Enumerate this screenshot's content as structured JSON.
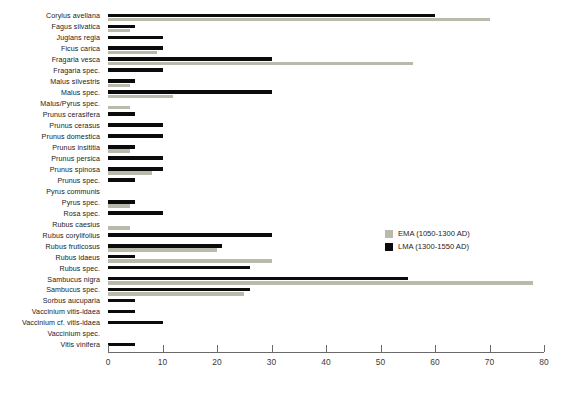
{
  "chart_data": {
    "type": "bar",
    "orientation": "horizontal",
    "title": "",
    "subtitle": "",
    "xlabel": "",
    "ylabel": "",
    "xlim": [
      0,
      80
    ],
    "xticks": [
      0,
      10,
      20,
      30,
      40,
      50,
      60,
      70,
      80
    ],
    "grid": false,
    "legend_position": "middle-right",
    "colors": {
      "ema": "#b9b9ac",
      "lma": "#0b0b0b",
      "axis": "#6a6a6a",
      "text": "#222222",
      "background": "#ffffff"
    },
    "categories": [
      "Corylus avellana",
      "Fagus silvatica",
      "Juglans regia",
      "Ficus carica",
      "Fragaria vesca",
      "Fragaria spec.",
      "Malus silvestris",
      "Malus spec.",
      "Malus/Pyrus spec.",
      "Prunus cerasifera",
      "Prunus cerasus",
      "Prunus domestica",
      "Prunus insititia",
      "Prunus persica",
      "Prunus spinosa",
      "Prunus spec.",
      "Pyrus communis",
      "Pyrus spec.",
      "Rosa spec.",
      "Rubus caesius",
      "Rubus corylifolius",
      "Rubus fruticosus",
      "Rubus idaeus",
      "Rubus spec.",
      "Sambucus nigra",
      "Sambucus spec.",
      "Sorbus aucuparia",
      "Vaccinium vitis-idaea",
      "Vaccinium cf. vitis-idaea",
      "Vaccinium spec.",
      "Vitis vinifera"
    ],
    "series": [
      {
        "name": "EMA (1050-1300 AD)",
        "key": "ema",
        "color": "#b9b9ac",
        "values": [
          70,
          4,
          0,
          9,
          56,
          0,
          4,
          12,
          4,
          0,
          0,
          0,
          4,
          0,
          8,
          0,
          0,
          4,
          0,
          4,
          0,
          20,
          30,
          0,
          78,
          25,
          0,
          0,
          0,
          0,
          0
        ]
      },
      {
        "name": "LMA (1300-1550 AD)",
        "key": "lma",
        "color": "#0b0b0b",
        "values": [
          60,
          5,
          10,
          10,
          30,
          10,
          5,
          30,
          0,
          5,
          10,
          10,
          5,
          10,
          10,
          5,
          0,
          5,
          10,
          0,
          30,
          21,
          5,
          26,
          55,
          26,
          5,
          5,
          10,
          0,
          5
        ]
      }
    ]
  },
  "legend": {
    "items": [
      {
        "label": "EMA (1050-1300 AD)",
        "swatch": "ema"
      },
      {
        "label": "LMA (1300-1550 AD)",
        "swatch": "lma"
      }
    ]
  },
  "axis": {
    "tick_labels": [
      "0",
      "10",
      "20",
      "30",
      "40",
      "50",
      "60",
      "70",
      "80"
    ]
  }
}
